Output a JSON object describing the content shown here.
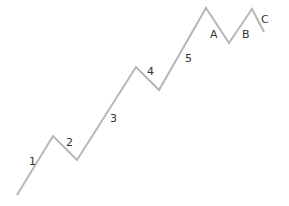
{
  "diagram": {
    "title": "",
    "type": "elliott-wave",
    "line_color": "#b7b7b7",
    "label_color": "#333333",
    "points": [
      {
        "x": 17,
        "y": 195
      },
      {
        "x": 53,
        "y": 136
      },
      {
        "x": 77,
        "y": 160
      },
      {
        "x": 136,
        "y": 67
      },
      {
        "x": 159,
        "y": 90
      },
      {
        "x": 206,
        "y": 8
      },
      {
        "x": 229,
        "y": 43
      },
      {
        "x": 252,
        "y": 9
      },
      {
        "x": 264,
        "y": 32
      }
    ],
    "labels": [
      {
        "text": "1",
        "x": 29,
        "y": 165
      },
      {
        "text": "2",
        "x": 66,
        "y": 146
      },
      {
        "text": "3",
        "x": 110,
        "y": 122
      },
      {
        "text": "4",
        "x": 147,
        "y": 75
      },
      {
        "text": "5",
        "x": 185,
        "y": 62
      },
      {
        "text": "A",
        "x": 210,
        "y": 38
      },
      {
        "text": "B",
        "x": 242,
        "y": 38
      },
      {
        "text": "C",
        "x": 261,
        "y": 23
      }
    ]
  }
}
